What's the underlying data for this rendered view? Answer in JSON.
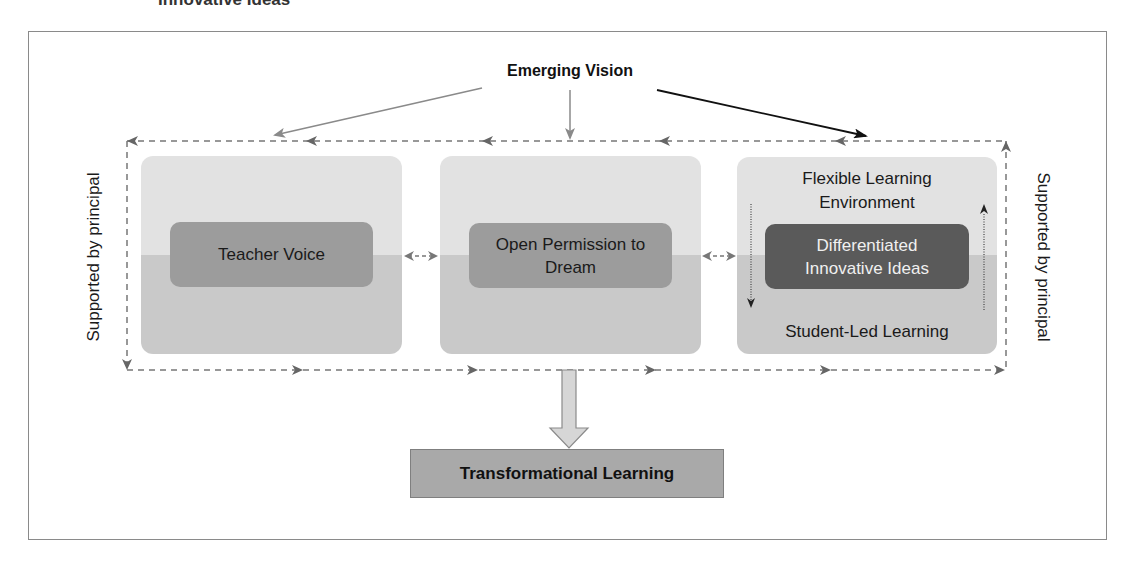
{
  "heading_partial": "Innovative Ideas",
  "diagram": {
    "top_label": "Emerging Vision",
    "side_labels": {
      "left": "Supported by principal",
      "right": "Supported by principal"
    },
    "panels": [
      {
        "id": "teacher-voice",
        "chip": "Teacher Voice"
      },
      {
        "id": "open-permission",
        "chip": "Open Permission to Dream"
      },
      {
        "id": "flexible-learning",
        "top_text": "Flexible Learning Environment",
        "chip": "Differentiated Innovative Ideas",
        "bottom_text": "Student-Led Learning"
      }
    ],
    "outcome": "Transformational Learning"
  },
  "colors": {
    "panel_light": "#e2e2e2",
    "panel_dark": "#c9c9c9",
    "chip_mid": "#9c9c9c",
    "chip_dark": "#5a5a5a",
    "outcome_fill": "#a9a9a9",
    "dashed_line": "#777777"
  }
}
